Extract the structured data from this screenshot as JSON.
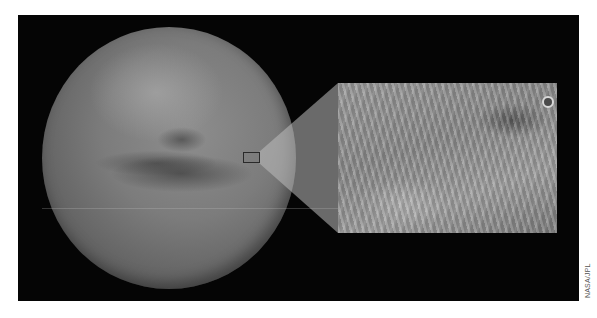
{
  "figure": {
    "main_image": "mars-globe",
    "inset_image": "surface-channels-closeup",
    "colors": {
      "background": "#050505",
      "page": "#ffffff",
      "beam": "#b4b4b4",
      "globe": "#7c7c7c"
    }
  },
  "credit": {
    "text": "NASA/JPL"
  }
}
